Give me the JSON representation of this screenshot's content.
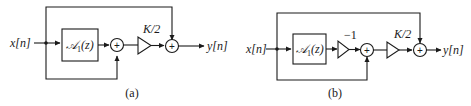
{
  "figure": {
    "diagrams": [
      {
        "id": "a",
        "caption": "(a)",
        "input_label": "x[n]",
        "output_label": "y[n]",
        "block_label": "𝒜₁(z)",
        "block_label_main": "𝒜",
        "block_label_sub": "1",
        "block_label_arg": "(z)",
        "gain_labels": [
          "K/2"
        ],
        "summer_symbol": "+"
      },
      {
        "id": "b",
        "caption": "(b)",
        "input_label": "x[n]",
        "output_label": "y[n]",
        "block_label": "𝒜₁(z)",
        "block_label_main": "𝒜",
        "block_label_sub": "1",
        "block_label_arg": "(z)",
        "gain_labels": [
          "−1",
          "K/2"
        ],
        "summer_symbol": "+"
      }
    ]
  }
}
